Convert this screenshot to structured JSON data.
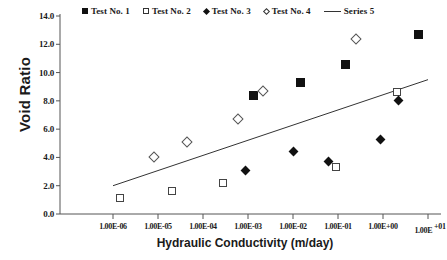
{
  "chart_data": {
    "type": "scatter",
    "title": "",
    "xlabel": "Hydraulic Conductivity (m/day)",
    "ylabel": "Void Ratio",
    "xscale": "log",
    "xlim": [
      1e-06,
      10.0
    ],
    "ylim": [
      0.0,
      14.0
    ],
    "xticklabels": [
      "1.00E-06",
      "1.00E-05",
      "1.00E-04",
      "1.00E-03",
      "1.00E-02",
      "1.00E-01",
      "1.00E+00",
      "1.00E+01"
    ],
    "xtickvalues": [
      1e-06,
      1e-05,
      0.0001,
      0.001,
      0.01,
      0.1,
      1.0,
      10.0
    ],
    "yticklabels": [
      "0.0",
      "2.0",
      "4.0",
      "6.0",
      "8.0",
      "10.0",
      "12.0",
      "14.0"
    ],
    "ytickvalues": [
      0.0,
      2.0,
      4.0,
      6.0,
      8.0,
      10.0,
      12.0,
      14.0
    ],
    "grid": false,
    "legend_position": "top",
    "series": [
      {
        "name": "Test No. 1",
        "marker": "filled-square",
        "color": "#111111",
        "points": [
          {
            "x": 0.0013,
            "y": 8.4
          },
          {
            "x": 0.015,
            "y": 9.3
          },
          {
            "x": 0.15,
            "y": 10.6
          },
          {
            "x": 6.0,
            "y": 12.7
          }
        ]
      },
      {
        "name": "Test No. 2",
        "marker": "open-square",
        "color": "#444444",
        "points": [
          {
            "x": 1.4e-06,
            "y": 1.1
          },
          {
            "x": 2e-05,
            "y": 1.6
          },
          {
            "x": 0.00028,
            "y": 2.2
          },
          {
            "x": 0.09,
            "y": 3.3
          },
          {
            "x": 2.0,
            "y": 8.6
          }
        ]
      },
      {
        "name": "Test No. 3",
        "marker": "filled-diamond",
        "color": "#111111",
        "points": [
          {
            "x": 0.0009,
            "y": 3.1
          },
          {
            "x": 0.01,
            "y": 4.4
          },
          {
            "x": 0.06,
            "y": 3.7
          },
          {
            "x": 0.9,
            "y": 5.3
          },
          {
            "x": 2.2,
            "y": 8.0
          }
        ]
      },
      {
        "name": "Test No. 4",
        "marker": "open-diamond",
        "color": "#555555",
        "points": [
          {
            "x": 8e-06,
            "y": 4.0
          },
          {
            "x": 4.5e-05,
            "y": 5.1
          },
          {
            "x": 0.0006,
            "y": 6.7
          },
          {
            "x": 0.0022,
            "y": 8.7
          },
          {
            "x": 0.25,
            "y": 12.4
          }
        ]
      },
      {
        "name": "Series 5",
        "marker": "line",
        "color": "#333333",
        "line": [
          {
            "x": 1e-06,
            "y": 2.0
          },
          {
            "x": 10.0,
            "y": 9.5
          }
        ]
      }
    ]
  },
  "legend": {
    "items": [
      {
        "label": "Test No. 1",
        "marker": "filled-square"
      },
      {
        "label": "Test No. 2",
        "marker": "open-square"
      },
      {
        "label": "Test No. 3",
        "marker": "filled-diamond"
      },
      {
        "label": "Test No. 4",
        "marker": "open-diamond"
      },
      {
        "label": "Series 5",
        "marker": "line"
      }
    ]
  },
  "axes": {
    "y_title": "Void Ratio",
    "x_title": "Hydraulic Conductivity (m/day)"
  }
}
